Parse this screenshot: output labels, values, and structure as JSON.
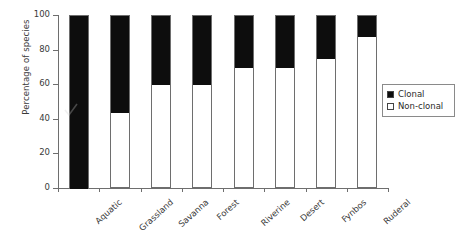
{
  "chart_data": {
    "type": "bar",
    "subtype": "stacked-100-percent",
    "title": "",
    "xlabel": "",
    "ylabel": "Percentage of species",
    "ylim": [
      0,
      100
    ],
    "yticks": [
      0,
      20,
      40,
      60,
      80,
      100
    ],
    "ytick_labels": [
      "0",
      "20",
      "40",
      "60",
      "80",
      "100"
    ],
    "grid": false,
    "legend_position": "right",
    "categories": [
      "Aquatic",
      "Grassland",
      "Savanna",
      "Forest",
      "Riverine",
      "Desert",
      "Fynbos",
      "Ruderal"
    ],
    "series": [
      {
        "name": "Clonal",
        "color": "#0d0d0d",
        "values": [
          100,
          56,
          40,
          40,
          30,
          30,
          25,
          12
        ]
      },
      {
        "name": "Non-clonal",
        "color": "#ffffff",
        "values": [
          0,
          44,
          60,
          60,
          70,
          70,
          75,
          88
        ]
      }
    ],
    "stack_boundaries_percent": [
      100,
      44,
      60,
      60,
      70,
      70,
      75,
      88
    ]
  },
  "legend": {
    "items": [
      {
        "label": "Clonal",
        "swatch": "filled"
      },
      {
        "label": "Non-clonal",
        "swatch": "hollow"
      }
    ]
  }
}
